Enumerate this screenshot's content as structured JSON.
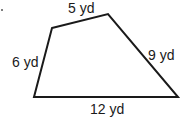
{
  "figure": {
    "type": "quadrilateral",
    "stroke_color": "#1a1a1a",
    "vertices": [
      [
        52,
        28
      ],
      [
        108,
        14
      ],
      [
        178,
        97
      ],
      [
        34,
        97
      ]
    ],
    "sides": {
      "top": "5 yd",
      "left": "6 yd",
      "right": "9 yd",
      "bottom": "12 yd"
    }
  }
}
